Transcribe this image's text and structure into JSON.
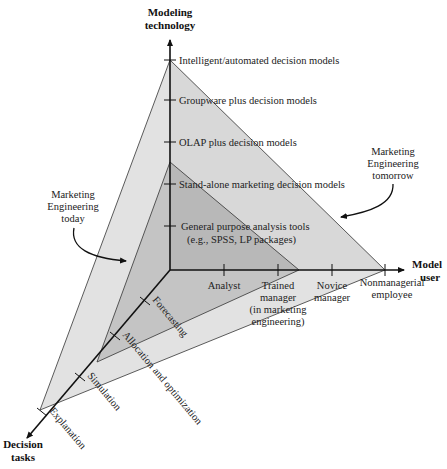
{
  "axes": {
    "vertical": {
      "title_line1": "Modeling",
      "title_line2": "technology",
      "ticks": [
        "Intelligent/automated decision models",
        "Groupware plus decision models",
        "OLAP  plus decision models",
        "Stand-alone marketing decision models",
        "General purpose analysis tools",
        "(e.g., SPSS, LP packages)"
      ]
    },
    "horizontal": {
      "title_line1": "Model",
      "title_line2": "user",
      "ticks": {
        "analyst": "Analyst",
        "trained_1": "Trained",
        "trained_2": "manager",
        "trained_3": "(in marketing",
        "trained_4": "engineering)",
        "novice_1": "Novice",
        "novice_2": "manager",
        "nonmgr_1": "Nonmanagerial",
        "nonmgr_2": "employee"
      }
    },
    "diagonal": {
      "title_line1": "Decision",
      "title_line2": "tasks",
      "ticks": [
        "Forecasting",
        "Allocation and optimization",
        "Simulation",
        "Explanation"
      ]
    }
  },
  "annotations": {
    "today_1": "Marketing",
    "today_2": "Engineering",
    "today_3": "today",
    "tomorrow_1": "Marketing",
    "tomorrow_2": "Engineering",
    "tomorrow_3": "tomorrow"
  },
  "colors": {
    "outer_region": "#dcdcdc",
    "inner_region": "#bdbdbd",
    "lines": "#111111"
  }
}
